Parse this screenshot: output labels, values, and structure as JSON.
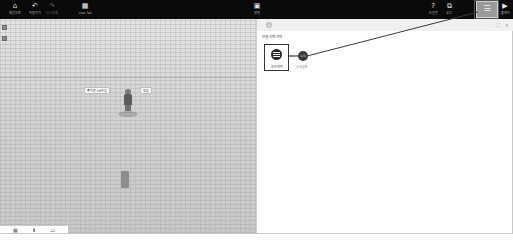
{
  "toolbar": {
    "items": [
      {
        "id": "home",
        "icon": "⌂",
        "label": "처음으로"
      },
      {
        "id": "undo",
        "icon": "↶",
        "label": "되돌리기"
      },
      {
        "id": "redo",
        "icon": "↷",
        "label": "다시실행"
      },
      {
        "id": "view",
        "icon": "▦",
        "label": "View Tab"
      },
      {
        "id": "center",
        "icon": "▣",
        "label": "장면"
      },
      {
        "id": "help",
        "icon": "?",
        "label": "도움말"
      },
      {
        "id": "code",
        "icon": "⧉",
        "label": "코딩"
      },
      {
        "id": "object",
        "icon": "☰",
        "label": "오브젝트"
      },
      {
        "id": "play",
        "icon": "▶",
        "label": "플레이"
      }
    ],
    "active_item": "object"
  },
  "viewport": {
    "bubbles": {
      "left": "좋가운 VR수업",
      "right": "정답"
    },
    "view_tabs": [
      "▦",
      "⬆",
      "▭"
    ]
  },
  "panel": {
    "header": {
      "plus": "+",
      "expand": "⛶",
      "close": "×"
    },
    "section_title": "모델 선택 선택",
    "object_card": {
      "label": "오브젝트"
    },
    "badge": {
      "text": "1/3"
    },
    "secondary_label": "스크립트"
  },
  "annotation": {
    "color": "#3a3a3a"
  }
}
